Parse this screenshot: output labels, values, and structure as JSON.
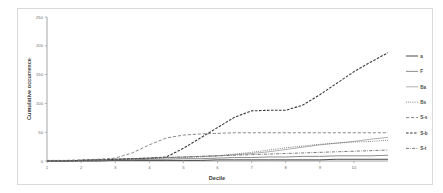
{
  "chart_data": {
    "type": "line",
    "title": "",
    "xlabel": "Decile",
    "ylabel": "Cumulative occurrence",
    "xlim": [
      1,
      11
    ],
    "ylim": [
      0,
      250
    ],
    "grid": false,
    "legend_position": "right",
    "x_ticks": [
      "1",
      "2",
      "3",
      "4",
      "5",
      "6",
      "7",
      "8",
      "9",
      "10"
    ],
    "y_ticks": [
      "0",
      "50",
      "100",
      "150",
      "200",
      "250"
    ],
    "x": [
      1,
      1.5,
      2,
      2.5,
      3,
      3.5,
      4,
      4.5,
      5,
      5.5,
      6,
      6.5,
      7,
      7.5,
      8,
      8.5,
      9,
      9.5,
      10,
      10.5,
      11
    ],
    "series": [
      {
        "name": "a",
        "label": "a",
        "style": "solid",
        "color": "#4a4a4a",
        "width": 1.0,
        "values": [
          0,
          0,
          0,
          0,
          1,
          1,
          1,
          1,
          1,
          1,
          2,
          2,
          2,
          2,
          2,
          2,
          2,
          3,
          3,
          3,
          3
        ]
      },
      {
        "name": "F",
        "label": "F",
        "style": "solid",
        "color": "#707070",
        "width": 0.8,
        "values": [
          0,
          0,
          1,
          1,
          2,
          2,
          3,
          3,
          4,
          4,
          5,
          6,
          6,
          7,
          7,
          8,
          8,
          9,
          9,
          9,
          10
        ]
      },
      {
        "name": "Ba",
        "label": "Ba",
        "style": "solid",
        "color": "#9a9a9a",
        "width": 0.8,
        "values": [
          0,
          0,
          1,
          2,
          3,
          4,
          5,
          6,
          7,
          8,
          9,
          11,
          13,
          16,
          20,
          24,
          28,
          31,
          34,
          38,
          41
        ]
      },
      {
        "name": "Bs",
        "label": "Bs",
        "style": "dotted",
        "color": "#5a5a5a",
        "width": 0.9,
        "values": [
          0,
          0,
          1,
          1,
          2,
          3,
          4,
          5,
          6,
          7,
          9,
          12,
          15,
          19,
          23,
          26,
          29,
          31,
          33,
          34,
          36
        ]
      },
      {
        "name": "S-s",
        "label": "S-s",
        "style": "dashed",
        "color": "#8a8a8a",
        "width": 1.0,
        "values": [
          1,
          1,
          2,
          3,
          5,
          14,
          28,
          40,
          45,
          47,
          48,
          49,
          49,
          49,
          49,
          49,
          49,
          49,
          49,
          49,
          49
        ]
      },
      {
        "name": "S-b",
        "label": "S-b",
        "style": "dashdot-long",
        "color": "#3a3a3a",
        "width": 1.1,
        "values": [
          0,
          0,
          1,
          2,
          3,
          4,
          5,
          7,
          22,
          40,
          58,
          76,
          87,
          88,
          88,
          97,
          115,
          135,
          155,
          172,
          188
        ]
      },
      {
        "name": "S-t",
        "label": "S-t",
        "style": "dashdot",
        "color": "#6a6a6a",
        "width": 0.9,
        "values": [
          0,
          0,
          1,
          2,
          3,
          4,
          5,
          6,
          7,
          8,
          9,
          10,
          11,
          12,
          13,
          14,
          15,
          16,
          17,
          18,
          19
        ]
      }
    ]
  },
  "legend": {
    "entries": [
      {
        "label": "a",
        "style": "solid"
      },
      {
        "label": "F",
        "style": "solid"
      },
      {
        "label": "Ba",
        "style": "solid"
      },
      {
        "label": "Bs",
        "style": "dotted"
      },
      {
        "label": "S-s",
        "style": "dashed"
      },
      {
        "label": "S-b",
        "style": "dashdot-long"
      },
      {
        "label": "S-t",
        "style": "dashdot"
      }
    ]
  }
}
